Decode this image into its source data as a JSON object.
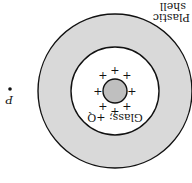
{
  "diagram": {
    "orientation": "rotated-180",
    "title_fragment": "",
    "labels": {
      "plastic_line1": "Plastic",
      "plastic_line2": "shell",
      "glass": "Glass; +Q",
      "point": "P"
    },
    "charge_symbol": "+",
    "charge_count": 8,
    "colors": {
      "shell_fill": "#d9d9d9",
      "sphere_fill": "#bfbfbf",
      "stroke": "#111111",
      "background": "#ffffff"
    },
    "geometry": {
      "center": [
        115,
        91
      ],
      "outer_radius": 77,
      "inner_radius": 44,
      "sphere_radius": 12,
      "point_p": [
        10,
        89
      ]
    }
  }
}
